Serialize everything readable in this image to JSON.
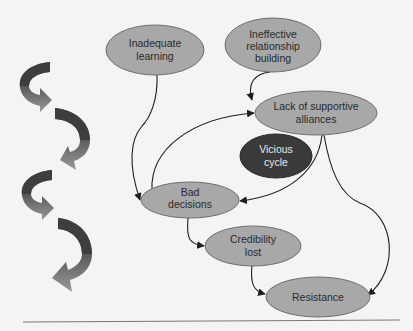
{
  "diagram": {
    "title_node": {
      "id": "vicious",
      "lines": [
        "Vicious",
        "cycle"
      ]
    },
    "nodes": [
      {
        "id": "inadequate",
        "lines": [
          "Inadequate",
          "learning"
        ]
      },
      {
        "id": "ineffective",
        "lines": [
          "Ineffective",
          "relationship",
          "building"
        ]
      },
      {
        "id": "lack",
        "lines": [
          "Lack of supportive",
          "alliances"
        ]
      },
      {
        "id": "bad",
        "lines": [
          "Bad",
          "decisions"
        ]
      },
      {
        "id": "credibility",
        "lines": [
          "Credibility",
          "lost"
        ]
      },
      {
        "id": "resistance",
        "lines": [
          "Resistance"
        ]
      }
    ],
    "edges": [
      {
        "from": "inadequate",
        "to": "bad"
      },
      {
        "from": "ineffective",
        "to": "lack"
      },
      {
        "from": "bad",
        "to": "lack"
      },
      {
        "from": "lack",
        "to": "bad"
      },
      {
        "from": "lack",
        "to": "resistance"
      },
      {
        "from": "bad",
        "to": "credibility"
      },
      {
        "from": "credibility",
        "to": "resistance"
      }
    ],
    "colors": {
      "background": "#f4f4f2",
      "node_fill": "#a8a8a8",
      "node_stroke": "#6e6e6e",
      "center_fill": "#3a3a3a",
      "edge": "#1e1e1e",
      "swirl_dark": "#4a4a4a",
      "swirl_light": "#8c8c8c"
    },
    "decoration": {
      "swirl_arrows": 4,
      "icon": "spiral-down-arrows"
    }
  }
}
